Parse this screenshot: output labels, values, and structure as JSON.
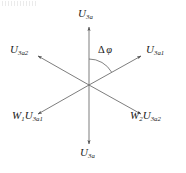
{
  "figure": {
    "width": 186,
    "height": 173,
    "background_color": "#ffffff",
    "line_color": "#595959",
    "text_color": "#1a1a1a"
  },
  "center": {
    "x": 89,
    "y": 85
  },
  "angle_annotation": {
    "name": "delta-phi",
    "delta_symbol": "Δ",
    "phi_symbol": "φ",
    "text": "Δ φ",
    "between_rays": [
      "u3a-top",
      "u3a1-right"
    ],
    "arc_radius": 26
  },
  "labels": {
    "u3a_top": {
      "base": "U",
      "sub": "3a",
      "text": "U3a"
    },
    "u3a2_left": {
      "base": "U",
      "sub": "3a2",
      "text": "U3a2"
    },
    "u3a1_right": {
      "base": "U",
      "sub": "3a1",
      "text": "U3a1"
    },
    "w1u3a1": {
      "prefix_base": "W",
      "prefix_sub": "1",
      "base": "U",
      "sub": "3a1",
      "text": "W1U3a1"
    },
    "w2u3a2": {
      "prefix_base": "W",
      "prefix_sub": "2",
      "base": "U",
      "sub": "3a2",
      "text": "W2U3a2"
    },
    "u3a_bottom": {
      "base": "U",
      "sub": "3a",
      "text": "U3a"
    }
  },
  "chart_data": {
    "type": "scatter",
    "xlabel": "",
    "ylabel": "",
    "series": [
      {
        "name": "phasor-rays",
        "points": [
          {
            "label": "U3a",
            "angle_deg": 90,
            "length": 59,
            "arrow": true
          },
          {
            "label": "U3a2",
            "angle_deg": 150,
            "length": 60,
            "arrow": true
          },
          {
            "label": "U3a1",
            "angle_deg": 30,
            "length": 60,
            "arrow": true
          },
          {
            "label": "W1U3a1",
            "angle_deg": 210,
            "length": 60,
            "arrow": true
          },
          {
            "label": "W2U3a2",
            "angle_deg": 330,
            "length": 60,
            "arrow": true
          },
          {
            "label": "U3a",
            "angle_deg": 270,
            "length": 59,
            "arrow": true
          }
        ]
      }
    ],
    "annotations": [
      {
        "text": "Δ φ",
        "type": "angle-arc",
        "from_deg": 30,
        "to_deg": 90
      }
    ],
    "grid": false,
    "legend": "none"
  }
}
